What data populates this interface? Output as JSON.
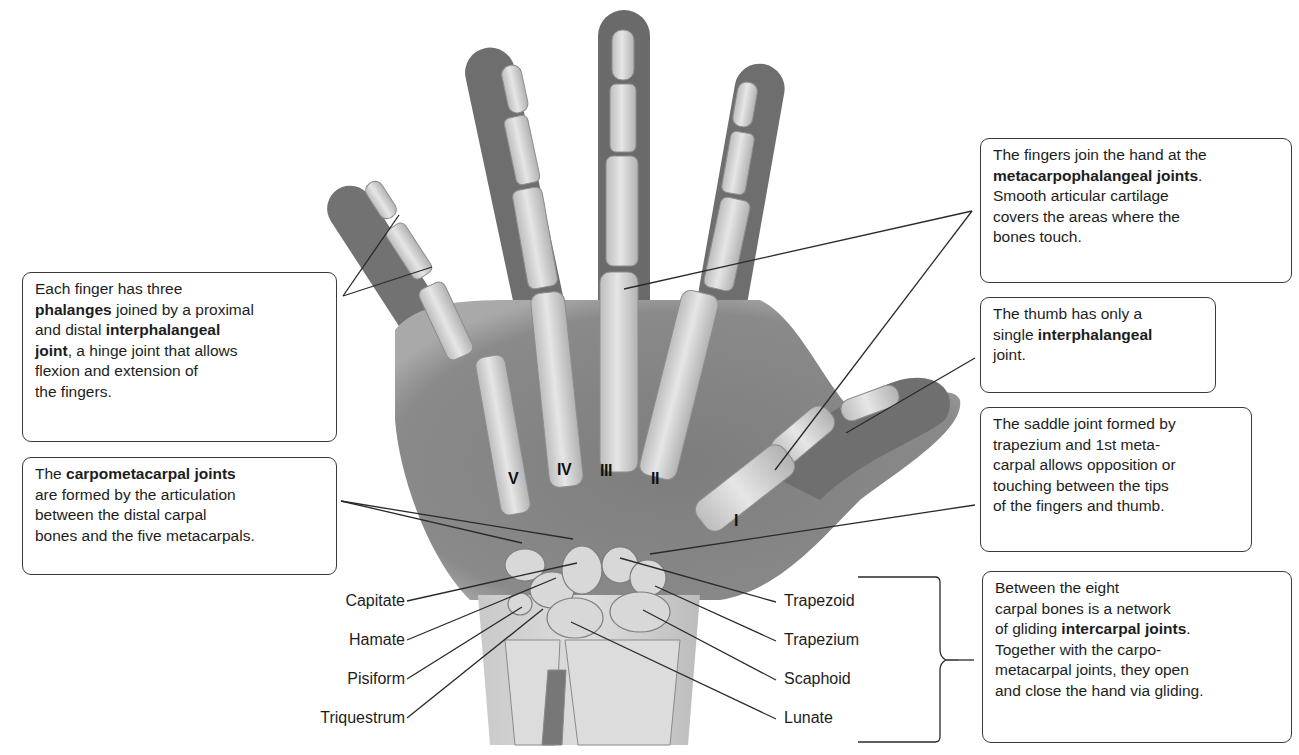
{
  "figure": {
    "colors": {
      "background": "#ffffff",
      "skin_shadow": "#6f6f6f",
      "bone": "#d4d4d4",
      "leader_line": "#2a2a2a",
      "box_border": "#3a3a3a"
    }
  },
  "callouts": {
    "phalanges": {
      "lines": [
        [
          {
            "t": "Each finger has three",
            "b": false
          }
        ],
        [
          {
            "t": "phalanges",
            "b": true
          },
          {
            "t": " joined by a proximal",
            "b": false
          }
        ],
        [
          {
            "t": "and distal ",
            "b": false
          },
          {
            "t": "interphalangeal",
            "b": true
          }
        ],
        [
          {
            "t": "joint",
            "b": true
          },
          {
            "t": ", a hinge joint that allows",
            "b": false
          }
        ],
        [
          {
            "t": "flexion and extension of",
            "b": false
          }
        ],
        [
          {
            "t": "the fingers.",
            "b": false
          }
        ]
      ]
    },
    "carpometacarpal": {
      "lines": [
        [
          {
            "t": "The ",
            "b": false
          },
          {
            "t": "carpometacarpal joints",
            "b": true
          }
        ],
        [
          {
            "t": "are formed by the articulation",
            "b": false
          }
        ],
        [
          {
            "t": "between the distal carpal",
            "b": false
          }
        ],
        [
          {
            "t": "bones and the five metacarpals.",
            "b": false
          }
        ]
      ]
    },
    "metacarpophalangeal": {
      "lines": [
        [
          {
            "t": "The fingers join the hand at the",
            "b": false
          }
        ],
        [
          {
            "t": "metacarpophalangeal joints",
            "b": true
          },
          {
            "t": ".",
            "b": false
          }
        ],
        [
          {
            "t": "Smooth articular cartilage",
            "b": false
          }
        ],
        [
          {
            "t": "covers the areas where the",
            "b": false
          }
        ],
        [
          {
            "t": "bones touch.",
            "b": false
          }
        ]
      ]
    },
    "thumb": {
      "lines": [
        [
          {
            "t": "The thumb has only a",
            "b": false
          }
        ],
        [
          {
            "t": "single ",
            "b": false
          },
          {
            "t": "interphalangeal",
            "b": true
          }
        ],
        [
          {
            "t": "joint.",
            "b": false
          }
        ]
      ]
    },
    "saddle": {
      "lines": [
        [
          {
            "t": "The saddle joint formed by",
            "b": false
          }
        ],
        [
          {
            "t": "trapezium and 1st meta-",
            "b": false
          }
        ],
        [
          {
            "t": "carpal allows opposition or",
            "b": false
          }
        ],
        [
          {
            "t": "touching between the tips",
            "b": false
          }
        ],
        [
          {
            "t": "of the fingers and thumb.",
            "b": false
          }
        ]
      ]
    },
    "intercarpal": {
      "lines": [
        [
          {
            "t": "Between the eight",
            "b": false
          }
        ],
        [
          {
            "t": "carpal bones is a network",
            "b": false
          }
        ],
        [
          {
            "t": "of gliding ",
            "b": false
          },
          {
            "t": "intercarpal joints",
            "b": true
          },
          {
            "t": ".",
            "b": false
          }
        ],
        [
          {
            "t": "Together with the carpo-",
            "b": false
          }
        ],
        [
          {
            "t": "metacarpal joints, they open",
            "b": false
          }
        ],
        [
          {
            "t": "and close the hand via gliding.",
            "b": false
          }
        ]
      ]
    }
  },
  "carpal_labels": {
    "left": [
      "Capitate",
      "Hamate",
      "Pisiform",
      "Triquestrum"
    ],
    "right": [
      "Trapezoid",
      "Trapezium",
      "Scaphoid",
      "Lunate"
    ]
  },
  "metacarpal_numerals": [
    "V",
    "IV",
    "III",
    "II",
    "I"
  ]
}
